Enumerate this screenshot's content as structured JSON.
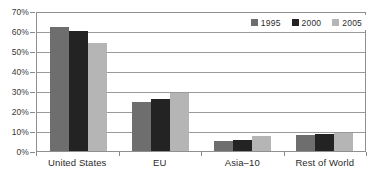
{
  "chart_data": {
    "type": "bar",
    "title": "",
    "subtitle": "",
    "xlabel": "",
    "ylabel": "",
    "categories": [
      "United States",
      "EU",
      "Asia–10",
      "Rest of World"
    ],
    "series": [
      {
        "name": "1995",
        "color": "#6e6e6e",
        "values": [
          62,
          24.5,
          5,
          8
        ]
      },
      {
        "name": "2000",
        "color": "#232323",
        "values": [
          60,
          26,
          5.5,
          8.5
        ]
      },
      {
        "name": "2005",
        "color": "#b5b5b5",
        "values": [
          54,
          29,
          7.5,
          9
        ]
      }
    ],
    "ylim": [
      0,
      70
    ],
    "y_tick_values": [
      0,
      10,
      20,
      30,
      40,
      50,
      60,
      70
    ],
    "y_tick_labels": [
      "0%",
      "10%",
      "20%",
      "30%",
      "40%",
      "50%",
      "60%",
      "70%"
    ],
    "grid": true,
    "legend_position": "top-right",
    "value_suffix": "%"
  },
  "axes": {
    "y": {
      "ticks": [
        {
          "value": 70,
          "label": "70%"
        },
        {
          "value": 60,
          "label": "60%"
        },
        {
          "value": 50,
          "label": "50%"
        },
        {
          "value": 40,
          "label": "40%"
        },
        {
          "value": 30,
          "label": "30%"
        },
        {
          "value": 20,
          "label": "20%"
        },
        {
          "value": 10,
          "label": "10%"
        },
        {
          "value": 0,
          "label": "0%"
        }
      ]
    },
    "x": {
      "labels": [
        "United States",
        "EU",
        "Asia–10",
        "Rest of World"
      ]
    }
  },
  "legend": {
    "entries": [
      {
        "label": "1995",
        "color": "#6e6e6e"
      },
      {
        "label": "2000",
        "color": "#232323"
      },
      {
        "label": "2005",
        "color": "#b5b5b5"
      }
    ]
  },
  "colors": {
    "series_1995": "#6e6e6e",
    "series_2000": "#232323",
    "series_2005": "#b5b5b5",
    "gridline": "#9a9a9a",
    "axis": "#8f8f8f",
    "text": "#2b2b2b",
    "background": "#ffffff"
  }
}
